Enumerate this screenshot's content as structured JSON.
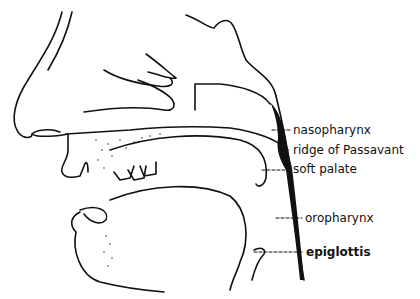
{
  "diagram": {
    "labels": [
      {
        "id": "nasopharynx",
        "text": "nasopharynx",
        "x": 293,
        "y": 124
      },
      {
        "id": "ridge-of-passavant",
        "text": "ridge of Passavant",
        "x": 293,
        "y": 145
      },
      {
        "id": "soft-palate",
        "text": "soft palate",
        "x": 293,
        "y": 164
      },
      {
        "id": "oropharynx",
        "text": "oropharynx",
        "x": 305,
        "y": 213
      },
      {
        "id": "epiglottis",
        "text": "epiglottis",
        "x": 306,
        "y": 246
      }
    ],
    "colors": {
      "line": "#111111",
      "background": "#ffffff"
    }
  }
}
